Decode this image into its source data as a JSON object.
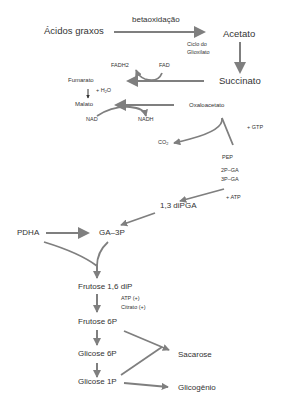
{
  "nodes": {
    "acidos_graxos": "Ácidos graxos",
    "betaoxidacao": "betaoxidação",
    "acetato": "Acetato",
    "ciclo_glioxilato_1": "Ciclo do",
    "ciclo_glioxilato_2": "Glioxilato",
    "fadh2": "FADH2",
    "fad": "FAD",
    "succinato": "Succinato",
    "fumarato": "Fumarato",
    "h2o_plus": "+ H",
    "h2o_sub": "2",
    "h2o_o": "O",
    "malato": "Malato",
    "oxaloacetato": "Oxaloacetato",
    "nad": "NAD",
    "nadh": "NADH",
    "gtp": "+ GTP",
    "co2_c": "CO",
    "co2_sub": "2",
    "pep": "PEP",
    "ga_2p": "2P–GA",
    "ga_3p_acid": "3P–GA",
    "atp_plus": "+ ATP",
    "dipga": "1,3 diPGA",
    "pdha": "PDHA",
    "ga3p": "GA–3P",
    "frutose16": "Frutose 1,6 diP",
    "reg_atp": "ATP   (+)",
    "reg_citrato": "Citrato (+)",
    "frutose6p": "Frutose 6P",
    "glicose6p": "Glicose 6P",
    "glicose1p": "Glicose 1P",
    "sacarose": "Sacarose",
    "glicogenio": "Glicogênio"
  },
  "colors": {
    "arrow": "#7f7f7f",
    "text": "#333333",
    "background": "#ffffff"
  }
}
